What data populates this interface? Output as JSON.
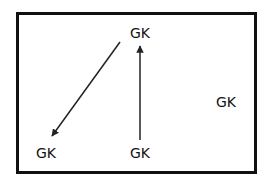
{
  "diagram": {
    "frame": {
      "border_color": "#111111",
      "background": "#ffffff"
    },
    "nodes": [
      {
        "id": "top",
        "label": "GK",
        "x": 140,
        "y": 33
      },
      {
        "id": "bottom-left",
        "label": "GK",
        "x": 46,
        "y": 153
      },
      {
        "id": "bottom-middle",
        "label": "GK",
        "x": 140,
        "y": 153
      },
      {
        "id": "right",
        "label": "GK",
        "x": 226,
        "y": 102
      }
    ],
    "edges": [
      {
        "from": "top",
        "to": "bottom-left",
        "x1": 120,
        "y1": 42,
        "x2": 52,
        "y2": 136
      },
      {
        "from": "bottom-middle",
        "to": "top",
        "x1": 140,
        "y1": 140,
        "x2": 140,
        "y2": 46
      }
    ],
    "line_color": "#222222"
  }
}
